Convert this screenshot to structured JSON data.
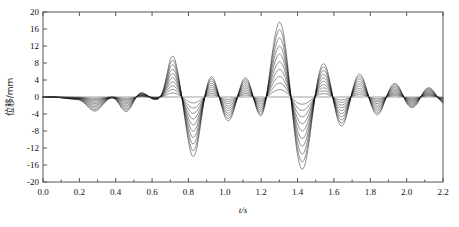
{
  "figure": {
    "background": "#ffffff",
    "frame_color": "#555555",
    "curve_color": "#000000"
  },
  "chart_data": {
    "type": "line",
    "title": "",
    "subtitle": "",
    "xlabel": "t/s",
    "ylabel": "位移/mm",
    "xlim": [
      0.0,
      2.2
    ],
    "ylim": [
      -20,
      20
    ],
    "grid": false,
    "legend": "none",
    "xticks": [
      0.0,
      0.2,
      0.4,
      0.6,
      0.8,
      1.0,
      1.2,
      1.4,
      1.6,
      1.8,
      2.0,
      2.2
    ],
    "xtick_labels": [
      "0.0",
      "0.2",
      "0.4",
      "0.6",
      "0.8",
      "1.0",
      "1.2",
      "1.4",
      "1.6",
      "1.8",
      "2.0",
      "2.2"
    ],
    "yticks": [
      20,
      16,
      12,
      8,
      4,
      0,
      -4,
      -8,
      -12,
      -16,
      -20
    ],
    "ytick_labels": [
      "20",
      "16",
      "12",
      "8",
      "4",
      "0",
      "-4",
      "-8",
      "-12",
      "-16",
      "-20"
    ],
    "n_series": 10,
    "series_scales": [
      1.0,
      0.9,
      0.79,
      0.68,
      0.575,
      0.47,
      0.37,
      0.275,
      0.185,
      0.1
    ],
    "x": [
      0.0,
      0.02,
      0.04,
      0.06,
      0.08,
      0.1,
      0.12,
      0.14,
      0.16,
      0.18,
      0.2,
      0.22,
      0.24,
      0.26,
      0.28,
      0.3,
      0.32,
      0.34,
      0.36,
      0.38,
      0.4,
      0.42,
      0.44,
      0.46,
      0.48,
      0.5,
      0.52,
      0.54,
      0.56,
      0.58,
      0.6,
      0.62,
      0.64,
      0.66,
      0.68,
      0.7,
      0.72,
      0.74,
      0.76,
      0.78,
      0.8,
      0.82,
      0.84,
      0.86,
      0.88,
      0.9,
      0.92,
      0.94,
      0.96,
      0.98,
      1.0,
      1.02,
      1.04,
      1.06,
      1.08,
      1.1,
      1.12,
      1.14,
      1.16,
      1.18,
      1.2,
      1.22,
      1.24,
      1.26,
      1.28,
      1.3,
      1.32,
      1.34,
      1.36,
      1.38,
      1.4,
      1.42,
      1.44,
      1.46,
      1.48,
      1.5,
      1.52,
      1.54,
      1.56,
      1.58,
      1.6,
      1.62,
      1.64,
      1.66,
      1.68,
      1.7,
      1.72,
      1.74,
      1.76,
      1.78,
      1.8,
      1.82,
      1.84,
      1.86,
      1.88,
      1.9,
      1.92,
      1.94,
      1.96,
      1.98,
      2.0,
      2.02,
      2.04,
      2.06,
      2.08,
      2.1,
      2.12,
      2.14,
      2.16,
      2.18,
      2.2
    ],
    "y_max_envelope": [
      0.0,
      0.0,
      0.0,
      0.0,
      -0.1,
      -0.2,
      -0.3,
      -0.4,
      -0.5,
      -0.6,
      -0.7,
      -1.2,
      -2.0,
      -2.8,
      -3.3,
      -3.1,
      -2.3,
      -1.3,
      -0.5,
      -0.2,
      -0.6,
      -1.8,
      -3.0,
      -3.4,
      -2.6,
      -1.0,
      0.4,
      1.0,
      0.8,
      0.2,
      -0.4,
      -0.6,
      -0.2,
      1.5,
      5.0,
      8.8,
      9.4,
      6.2,
      1.0,
      -5.0,
      -10.5,
      -13.8,
      -13.0,
      -8.5,
      -2.5,
      2.2,
      4.6,
      4.2,
      1.6,
      -1.8,
      -4.6,
      -5.6,
      -4.4,
      -1.6,
      1.6,
      4.0,
      4.4,
      2.6,
      -0.6,
      -3.4,
      -4.4,
      -2.0,
      3.5,
      10.0,
      15.2,
      17.6,
      15.6,
      9.6,
      1.5,
      -7.0,
      -13.6,
      -16.8,
      -16.0,
      -11.6,
      -5.2,
      1.2,
      5.8,
      7.8,
      6.8,
      3.2,
      -1.4,
      -5.2,
      -6.8,
      -5.8,
      -2.6,
      1.2,
      4.2,
      5.4,
      4.4,
      1.8,
      -1.2,
      -3.4,
      -4.2,
      -3.2,
      -1.0,
      1.2,
      2.8,
      3.2,
      2.2,
      0.4,
      -1.4,
      -2.4,
      -2.4,
      -1.4,
      0.2,
      1.6,
      2.2,
      1.8,
      0.6,
      -0.6,
      -1.4
    ]
  },
  "axis_titles": {
    "x": "t/s",
    "y": "位移/mm"
  }
}
